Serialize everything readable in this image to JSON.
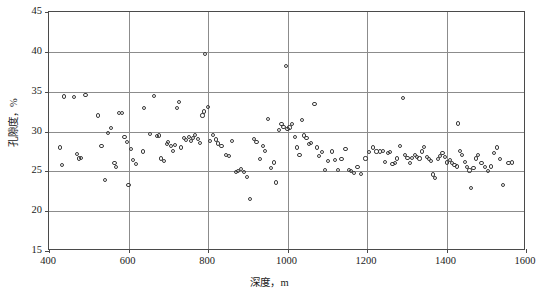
{
  "chart_data": {
    "type": "scatter",
    "title": "",
    "xlabel": "深度，m",
    "ylabel": "孔隙度，%",
    "xlim": [
      400,
      1600
    ],
    "ylim": [
      15,
      45
    ],
    "xticks": [
      400,
      600,
      800,
      1000,
      1200,
      1400,
      1600
    ],
    "yticks": [
      15,
      20,
      25,
      30,
      35,
      40,
      45
    ],
    "grid": true,
    "legend": null,
    "marker": "open-circle",
    "marker_color": "#3a3a3a",
    "series": [
      {
        "name": "孔隙度",
        "points": [
          [
            428,
            28.0
          ],
          [
            432,
            25.8
          ],
          [
            437,
            34.4
          ],
          [
            462,
            34.3
          ],
          [
            470,
            27.2
          ],
          [
            476,
            26.6
          ],
          [
            480,
            26.7
          ],
          [
            492,
            34.6
          ],
          [
            523,
            32.0
          ],
          [
            532,
            28.2
          ],
          [
            540,
            23.9
          ],
          [
            548,
            29.8
          ],
          [
            556,
            30.4
          ],
          [
            565,
            26.0
          ],
          [
            568,
            25.5
          ],
          [
            576,
            32.3
          ],
          [
            583,
            32.3
          ],
          [
            590,
            29.3
          ],
          [
            596,
            28.7
          ],
          [
            600,
            23.3
          ],
          [
            606,
            27.8
          ],
          [
            612,
            26.4
          ],
          [
            618,
            25.9
          ],
          [
            636,
            27.5
          ],
          [
            640,
            33.0
          ],
          [
            655,
            29.7
          ],
          [
            664,
            34.5
          ],
          [
            672,
            29.4
          ],
          [
            676,
            29.5
          ],
          [
            682,
            26.6
          ],
          [
            690,
            26.3
          ],
          [
            696,
            28.4
          ],
          [
            700,
            28.7
          ],
          [
            706,
            28.2
          ],
          [
            712,
            27.6
          ],
          [
            716,
            28.3
          ],
          [
            722,
            32.9
          ],
          [
            727,
            33.7
          ],
          [
            733,
            28.0
          ],
          [
            740,
            29.2
          ],
          [
            745,
            28.9
          ],
          [
            752,
            29.3
          ],
          [
            758,
            28.8
          ],
          [
            762,
            29.2
          ],
          [
            768,
            29.6
          ],
          [
            774,
            29.1
          ],
          [
            780,
            28.6
          ],
          [
            786,
            32.0
          ],
          [
            790,
            32.5
          ],
          [
            793,
            39.7
          ],
          [
            800,
            33.1
          ],
          [
            806,
            28.8
          ],
          [
            812,
            29.6
          ],
          [
            820,
            29.0
          ],
          [
            826,
            28.5
          ],
          [
            834,
            28.2
          ],
          [
            845,
            27.0
          ],
          [
            852,
            26.9
          ],
          [
            860,
            28.8
          ],
          [
            870,
            24.9
          ],
          [
            876,
            25.0
          ],
          [
            884,
            25.3
          ],
          [
            890,
            24.9
          ],
          [
            898,
            24.3
          ],
          [
            906,
            21.5
          ],
          [
            915,
            29.1
          ],
          [
            922,
            28.7
          ],
          [
            930,
            26.5
          ],
          [
            938,
            28.2
          ],
          [
            944,
            27.6
          ],
          [
            950,
            31.6
          ],
          [
            958,
            25.4
          ],
          [
            966,
            26.1
          ],
          [
            972,
            23.6
          ],
          [
            978,
            30.2
          ],
          [
            985,
            30.9
          ],
          [
            990,
            30.6
          ],
          [
            996,
            38.2
          ],
          [
            1000,
            30.3
          ],
          [
            1005,
            30.5
          ],
          [
            1012,
            30.9
          ],
          [
            1018,
            29.3
          ],
          [
            1024,
            28.0
          ],
          [
            1030,
            27.0
          ],
          [
            1036,
            31.4
          ],
          [
            1042,
            29.5
          ],
          [
            1048,
            29.2
          ],
          [
            1054,
            28.4
          ],
          [
            1060,
            28.6
          ],
          [
            1068,
            33.5
          ],
          [
            1074,
            28.0
          ],
          [
            1080,
            26.9
          ],
          [
            1086,
            27.4
          ],
          [
            1094,
            25.2
          ],
          [
            1102,
            26.3
          ],
          [
            1112,
            27.5
          ],
          [
            1120,
            26.4
          ],
          [
            1128,
            25.2
          ],
          [
            1136,
            26.5
          ],
          [
            1146,
            27.8
          ],
          [
            1154,
            25.2
          ],
          [
            1160,
            25.0
          ],
          [
            1168,
            24.8
          ],
          [
            1176,
            25.5
          ],
          [
            1184,
            24.7
          ],
          [
            1196,
            26.6
          ],
          [
            1206,
            27.4
          ],
          [
            1216,
            28.0
          ],
          [
            1224,
            27.5
          ],
          [
            1232,
            27.5
          ],
          [
            1240,
            27.6
          ],
          [
            1246,
            26.2
          ],
          [
            1252,
            27.3
          ],
          [
            1258,
            27.4
          ],
          [
            1264,
            25.9
          ],
          [
            1270,
            26.0
          ],
          [
            1276,
            26.6
          ],
          [
            1284,
            28.2
          ],
          [
            1290,
            34.2
          ],
          [
            1296,
            27.1
          ],
          [
            1302,
            26.7
          ],
          [
            1308,
            26.0
          ],
          [
            1314,
            26.7
          ],
          [
            1320,
            27.0
          ],
          [
            1326,
            26.8
          ],
          [
            1332,
            26.6
          ],
          [
            1338,
            27.5
          ],
          [
            1344,
            28.1
          ],
          [
            1350,
            26.8
          ],
          [
            1356,
            26.5
          ],
          [
            1360,
            26.3
          ],
          [
            1366,
            24.6
          ],
          [
            1372,
            24.2
          ],
          [
            1378,
            26.5
          ],
          [
            1384,
            26.9
          ],
          [
            1390,
            27.3
          ],
          [
            1396,
            26.8
          ],
          [
            1402,
            26.1
          ],
          [
            1408,
            26.4
          ],
          [
            1414,
            26.0
          ],
          [
            1420,
            25.8
          ],
          [
            1426,
            25.6
          ],
          [
            1428,
            31.0
          ],
          [
            1434,
            27.6
          ],
          [
            1440,
            27.0
          ],
          [
            1446,
            26.2
          ],
          [
            1452,
            25.5
          ],
          [
            1458,
            25.1
          ],
          [
            1462,
            22.9
          ],
          [
            1468,
            25.4
          ],
          [
            1474,
            26.6
          ],
          [
            1480,
            27.1
          ],
          [
            1488,
            26.0
          ],
          [
            1496,
            25.5
          ],
          [
            1504,
            25.0
          ],
          [
            1512,
            25.6
          ],
          [
            1520,
            27.3
          ],
          [
            1528,
            28.0
          ],
          [
            1534,
            26.5
          ],
          [
            1542,
            23.3
          ],
          [
            1556,
            26.0
          ],
          [
            1564,
            26.1
          ]
        ]
      }
    ]
  }
}
